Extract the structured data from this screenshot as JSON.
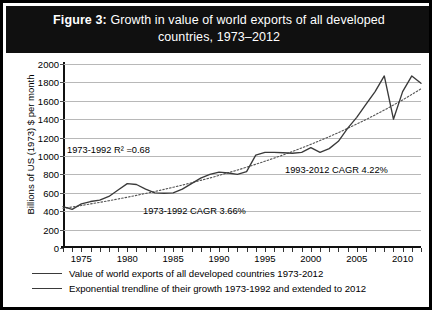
{
  "figure": {
    "label": "Figure 3:",
    "title": "Growth in value of world exports of all developed countries, 1973–2012"
  },
  "colors": {
    "title_bg": "#101010",
    "title_fg": "#ffffff",
    "frame": "#000000",
    "gridline": "#b8b8b8",
    "series": "#3a3a3a",
    "trendline": "#555555"
  },
  "annotations": {
    "r2": "1973-1992 R² =0.68",
    "cagr_early": "1973-1992 CAGR 3.66%",
    "cagr_late": "1993-2012 CAGR 4.22%"
  },
  "legend": {
    "items": [
      "Value of world exports of all developed countries 1973-2012",
      "Exponential trendline of their growth 1973-1992 and extended to 2012"
    ]
  },
  "chart_data": {
    "type": "line",
    "title": "Growth in value of world exports of all developed countries, 1973–2012",
    "xlabel": "",
    "ylabel": "Billions of US (1973) $ per month",
    "xlim": [
      1973,
      2012
    ],
    "ylim": [
      0,
      2000
    ],
    "ytick_step": 200,
    "yticks": [
      0,
      200,
      400,
      600,
      800,
      1000,
      1200,
      1400,
      1600,
      1800,
      2000
    ],
    "xticks_major": [
      1975,
      1980,
      1985,
      1990,
      1995,
      2000,
      2005,
      2010
    ],
    "xticks_minor_every": 1,
    "grid": true,
    "legend_position": "bottom",
    "x": [
      1973,
      1974,
      1975,
      1976,
      1977,
      1978,
      1979,
      1980,
      1981,
      1982,
      1983,
      1984,
      1985,
      1986,
      1987,
      1988,
      1989,
      1990,
      1991,
      1992,
      1993,
      1994,
      1995,
      1996,
      1997,
      1998,
      1999,
      2000,
      2001,
      2002,
      2003,
      2004,
      2005,
      2006,
      2007,
      2008,
      2009,
      2010,
      2011,
      2012
    ],
    "series": [
      {
        "name": "Value of world exports of all developed countries 1973-2012",
        "style": "solid",
        "values": [
          450,
          420,
          480,
          505,
          520,
          560,
          630,
          700,
          690,
          640,
          600,
          595,
          600,
          640,
          700,
          760,
          800,
          825,
          815,
          800,
          830,
          1010,
          1040,
          1040,
          1035,
          1030,
          1040,
          1090,
          1040,
          1080,
          1160,
          1300,
          1420,
          1560,
          1700,
          1870,
          1400,
          1700,
          1870,
          1790
        ]
      },
      {
        "name": "Exponential trendline of their growth 1973-1992 and extended to 2012",
        "style": "dotted",
        "values": [
          430,
          446,
          462,
          479,
          496,
          514,
          533,
          552,
          572,
          593,
          614,
          637,
          660,
          684,
          709,
          735,
          761,
          789,
          818,
          847,
          878,
          910,
          943,
          977,
          1012,
          1049,
          1087,
          1127,
          1168,
          1210,
          1254,
          1300,
          1347,
          1396,
          1447,
          1499,
          1554,
          1610,
          1669,
          1730
        ]
      }
    ]
  }
}
